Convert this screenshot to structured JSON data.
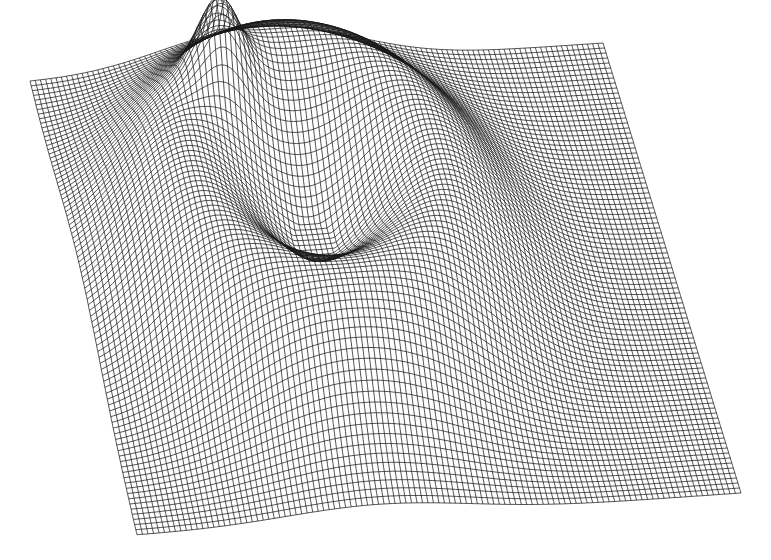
{
  "figure": {
    "caption_partial": "",
    "background": "#ffffff",
    "line_color": "#1a1a1a",
    "plane_shade": "#8a8a8a"
  },
  "chart_data": {
    "type": "surface",
    "title": "",
    "xlabel": "",
    "ylabel": "",
    "zlabel": "",
    "grid": true,
    "plane_corners_px": {
      "top_left": [
        30,
        82
      ],
      "top_right": [
        603,
        43
      ],
      "bottom_right": [
        741,
        493
      ],
      "bottom_left": [
        137,
        535
      ]
    },
    "mesh": {
      "rows": 90,
      "cols": 110
    },
    "ring": {
      "center_uv": [
        0.4,
        0.46
      ],
      "radius_u": 0.21,
      "radius_v": 0.26,
      "height_px": 120,
      "width": 0.07,
      "peak_uv": [
        0.28,
        0.26
      ],
      "peak_height_px": 70
    },
    "legend": []
  }
}
